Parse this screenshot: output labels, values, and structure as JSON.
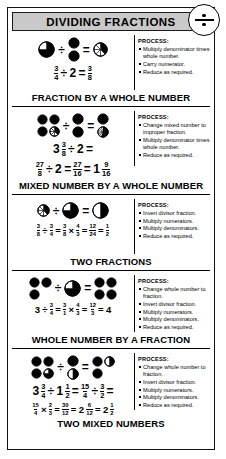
{
  "header": {
    "title": "DIVIDING FRACTIONS"
  },
  "badge": {
    "icon": "divide-symbol-icon"
  },
  "sections": [
    {
      "id": "fraction-by-whole-number",
      "caption": "FRACTION BY A WHOLE NUMBER",
      "process_heading": "PROCESS:",
      "process_steps": [
        "Multiply denominator times whole number.",
        "Carry numerator.",
        "Reduce as required."
      ],
      "equations": [
        {
          "display": "3/4 ÷ 2 = 3/8"
        }
      ],
      "diagram": {
        "dividend": {
          "shapes": [
            {
              "type": "pie",
              "segments": 4,
              "filled": 3
            }
          ]
        },
        "divisor": {
          "shapes": [
            {
              "type": "circle",
              "filled": 1
            },
            {
              "type": "circle",
              "filled": 1
            }
          ]
        },
        "result": {
          "shapes": [
            {
              "type": "pie",
              "segments": 8,
              "filled": 3
            }
          ]
        }
      }
    },
    {
      "id": "mixed-number-by-whole-number",
      "caption": "MIXED NUMBER BY A WHOLE NUMBER",
      "process_heading": "PROCESS:",
      "process_steps": [
        "Change mixed number to improper fraction.",
        "Multiply denominator times whole number.",
        "Reduce as required."
      ],
      "equations": [
        {
          "display": "3 3/8 ÷ 2 ="
        },
        {
          "display": "27/8 ÷ 2 = 27/16 = 1 9/16"
        }
      ],
      "diagram": {
        "dividend": {
          "shapes": [
            {
              "type": "circle",
              "filled": 1
            },
            {
              "type": "circle",
              "filled": 1
            },
            {
              "type": "circle",
              "filled": 1
            },
            {
              "type": "pie",
              "segments": 8,
              "filled": 3
            }
          ]
        },
        "divisor": {
          "shapes": [
            {
              "type": "circle",
              "filled": 1
            },
            {
              "type": "circle",
              "filled": 1
            }
          ]
        },
        "result": {
          "shapes": [
            {
              "type": "circle",
              "filled": 1
            },
            {
              "type": "pie",
              "segments": 16,
              "filled": 9
            }
          ]
        }
      }
    },
    {
      "id": "two-fractions",
      "caption": "TWO FRACTIONS",
      "process_heading": "PROCESS:",
      "process_steps": [
        "Invert divisor fraction.",
        "Multiply numerators.",
        "Multiply denominators.",
        "Reduce as required."
      ],
      "equations": [
        {
          "display": "3/8 ÷ 3/4 = 3/8 × 4/3 = 12/24 = 1/2"
        }
      ],
      "diagram": {
        "dividend": {
          "shapes": [
            {
              "type": "pie",
              "segments": 8,
              "filled": 3
            }
          ]
        },
        "divisor": {
          "shapes": [
            {
              "type": "pie",
              "segments": 4,
              "filled": 3
            }
          ]
        },
        "result": {
          "shapes": [
            {
              "type": "pie",
              "segments": 2,
              "filled": 1
            }
          ]
        }
      }
    },
    {
      "id": "whole-number-by-a-fraction",
      "caption": "WHOLE NUMBER BY A FRACTION",
      "process_heading": "PROCESS:",
      "process_steps": [
        "Change whole number to fraction.",
        "Invert divisor fraction.",
        "Multiply numerators.",
        "Multiply denominators.",
        "Reduce as required."
      ],
      "equations": [
        {
          "display": "3 ÷ 3/4 = 3/1 × 4/3 = 12/3 = 4"
        }
      ],
      "diagram": {
        "dividend": {
          "shapes": [
            {
              "type": "circle",
              "filled": 1
            },
            {
              "type": "circle",
              "filled": 1
            },
            {
              "type": "circle",
              "filled": 1
            }
          ]
        },
        "divisor": {
          "shapes": [
            {
              "type": "pie",
              "segments": 4,
              "filled": 3
            }
          ]
        },
        "result": {
          "shapes": [
            {
              "type": "circle",
              "filled": 1
            },
            {
              "type": "circle",
              "filled": 1
            },
            {
              "type": "circle",
              "filled": 1
            },
            {
              "type": "circle",
              "filled": 1
            }
          ]
        }
      }
    },
    {
      "id": "two-mixed-numbers",
      "caption": "TWO MIXED NUMBERS",
      "process_heading": "PROCESS:",
      "process_steps": [
        "Change whole number to fraction.",
        "Invert divisor fraction.",
        "Multiply numerators.",
        "Multiply denominators.",
        "Reduce as required."
      ],
      "equations": [
        {
          "display": "3 3/4 ÷ 1 1/2 = 15/4 ÷ 3/2 ="
        },
        {
          "display": "15/4 × 2/3 = 30/12 = 2 6/12 = 2 1/2"
        }
      ],
      "diagram": {
        "dividend": {
          "shapes": [
            {
              "type": "circle",
              "filled": 1
            },
            {
              "type": "circle",
              "filled": 1
            },
            {
              "type": "circle",
              "filled": 1
            },
            {
              "type": "pie",
              "segments": 4,
              "filled": 3
            }
          ]
        },
        "divisor": {
          "shapes": [
            {
              "type": "circle",
              "filled": 1
            },
            {
              "type": "pie",
              "segments": 2,
              "filled": 1
            }
          ]
        },
        "result": {
          "shapes": [
            {
              "type": "circle",
              "filled": 1
            },
            {
              "type": "pie",
              "segments": 2,
              "filled": 1
            },
            {
              "type": "circle",
              "filled": 1
            }
          ]
        }
      }
    }
  ],
  "symbols": {
    "divide": "÷",
    "equals": "=",
    "times": "×"
  },
  "colors": {
    "ink": "#000000",
    "header_bg": "#c9c9c9",
    "paper": "#ffffff"
  }
}
